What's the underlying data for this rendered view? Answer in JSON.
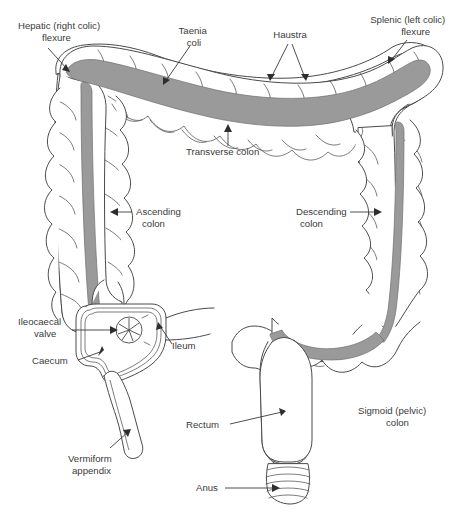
{
  "diagram": {
    "background_color": "#ffffff",
    "outline_color": "#4a4a4a",
    "taenia_color": "#9a9a9a",
    "text_color": "#3a3a3a",
    "labels": [
      {
        "id": "hepatic-flexure",
        "line1": "Hepatic (right colic)",
        "line2": "flexure",
        "x": 18,
        "y": 29,
        "anchor": "start"
      },
      {
        "id": "taenia-coli",
        "line1": "Taenia",
        "line2": "coli",
        "x": 194,
        "y": 34,
        "anchor": "middle"
      },
      {
        "id": "haustra",
        "line1": "Haustra",
        "line2": "",
        "x": 290,
        "y": 38,
        "anchor": "middle"
      },
      {
        "id": "splenic-flexure",
        "line1": "Splenic (left colic)",
        "line2": "flexure",
        "x": 448,
        "y": 23,
        "anchor": "end"
      },
      {
        "id": "transverse-colon",
        "line1": "Transverse colon",
        "line2": "",
        "x": 186,
        "y": 155,
        "anchor": "start"
      },
      {
        "id": "ascending-colon",
        "line1": "Ascending",
        "line2": "colon",
        "x": 136,
        "y": 215,
        "anchor": "start"
      },
      {
        "id": "descending-colon",
        "line1": "Descending",
        "line2": "colon",
        "x": 296,
        "y": 215,
        "anchor": "start"
      },
      {
        "id": "ileocaecal-valve",
        "line1": "Ileocaecal",
        "line2": "valve",
        "x": 18,
        "y": 325,
        "anchor": "start"
      },
      {
        "id": "ileum",
        "line1": "Ileum",
        "line2": "",
        "x": 172,
        "y": 349,
        "anchor": "start"
      },
      {
        "id": "caecum",
        "line1": "Caecum",
        "line2": "",
        "x": 32,
        "y": 364,
        "anchor": "start"
      },
      {
        "id": "vermiform-appendix",
        "line1": "Vermiform",
        "line2": "appendix",
        "x": 68,
        "y": 462,
        "anchor": "start"
      },
      {
        "id": "rectum",
        "line1": "Rectum",
        "line2": "",
        "x": 186,
        "y": 428,
        "anchor": "start"
      },
      {
        "id": "sigmoid-colon",
        "line1": "Sigmoid (pelvic)",
        "line2": "colon",
        "x": 358,
        "y": 414,
        "anchor": "start"
      },
      {
        "id": "anus",
        "line1": "Anus",
        "line2": "",
        "x": 196,
        "y": 491,
        "anchor": "start"
      }
    ],
    "parts": [
      "transverse colon",
      "ascending colon",
      "descending colon",
      "sigmoid colon",
      "caecum",
      "vermiform appendix",
      "ileum",
      "rectum",
      "anus",
      "taenia coli",
      "haustra"
    ]
  }
}
